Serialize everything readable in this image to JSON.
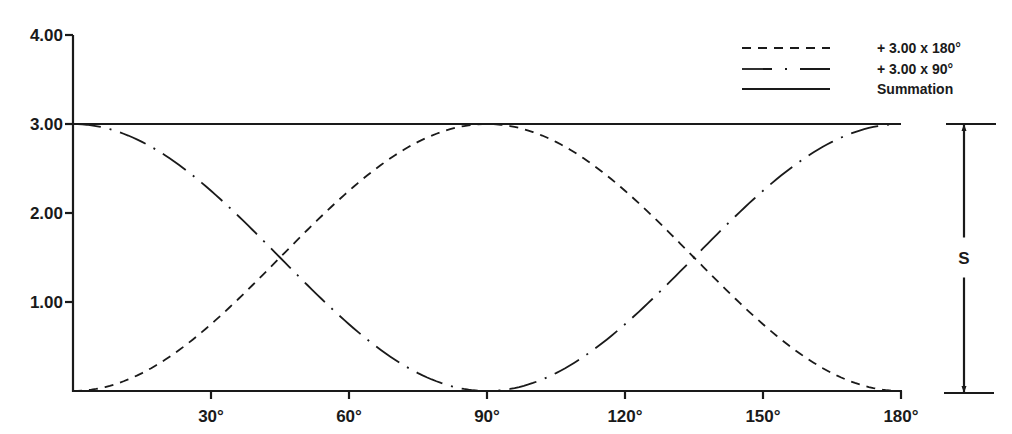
{
  "chart_data": {
    "type": "line",
    "title": "",
    "xlabel": "",
    "ylabel": "",
    "xlim": [
      0,
      180
    ],
    "ylim": [
      0,
      4
    ],
    "grid": false,
    "x_ticks": [
      30,
      60,
      90,
      120,
      150,
      180
    ],
    "x_tick_labels": [
      "30°",
      "60°",
      "90°",
      "120°",
      "150°",
      "180°"
    ],
    "y_ticks": [
      1,
      2,
      3,
      4
    ],
    "y_tick_labels": [
      "1.00",
      "2.00",
      "3.00",
      "4.00"
    ],
    "legend_position": "top-right",
    "series": [
      {
        "name": "+ 3.00 x 180°",
        "style": "dashed",
        "formula": "3.00 * sin^2(x)",
        "x": [
          0,
          15,
          30,
          45,
          60,
          75,
          90,
          105,
          120,
          135,
          150,
          165,
          180
        ],
        "values": [
          0.0,
          0.2,
          0.75,
          1.5,
          2.25,
          2.8,
          3.0,
          2.8,
          2.25,
          1.5,
          0.75,
          0.2,
          0.0
        ]
      },
      {
        "name": "+ 3.00 x 90°",
        "style": "dash-dot",
        "formula": "3.00 * cos^2(x)",
        "x": [
          0,
          15,
          30,
          45,
          60,
          75,
          90,
          105,
          120,
          135,
          150,
          165,
          180
        ],
        "values": [
          3.0,
          2.8,
          2.25,
          1.5,
          0.75,
          0.2,
          0.0,
          0.2,
          0.75,
          1.5,
          2.25,
          2.8,
          3.0
        ]
      },
      {
        "name": "Summation",
        "style": "solid",
        "x": [
          0,
          180
        ],
        "values": [
          3.0,
          3.0
        ]
      }
    ],
    "annotations": [
      {
        "text": "S",
        "description": "dimension bracket spanning from 0 to summation level 3.00"
      }
    ]
  }
}
